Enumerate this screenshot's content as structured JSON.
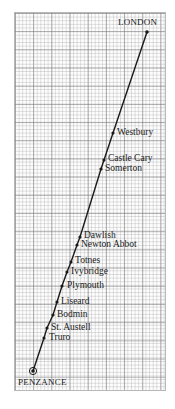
{
  "diagram": {
    "type": "line-route",
    "line_color": "#1a1a1a",
    "grid": {
      "left": 14,
      "top": 12,
      "width": 152,
      "height": 379,
      "minor_px": 3.64,
      "major_every": 5
    },
    "stations": [
      {
        "name": "LONDON",
        "x": 147,
        "y": 32,
        "label_x": 118,
        "label_y": 18,
        "terminal": true,
        "caps": true
      },
      {
        "name": "Westbury",
        "x": 113,
        "y": 133,
        "label_x": 117,
        "label_y": 128,
        "terminal": false
      },
      {
        "name": "Castle Cary",
        "x": 104,
        "y": 160,
        "label_x": 108,
        "label_y": 154,
        "terminal": false
      },
      {
        "name": "Somerton",
        "x": 101,
        "y": 169,
        "label_x": 105,
        "label_y": 164,
        "terminal": false
      },
      {
        "name": "Dawlish",
        "x": 80,
        "y": 237,
        "label_x": 84,
        "label_y": 231,
        "terminal": false
      },
      {
        "name": "Newton Abbot",
        "x": 77,
        "y": 245,
        "label_x": 81,
        "label_y": 240,
        "terminal": false
      },
      {
        "name": "Totnes",
        "x": 71,
        "y": 262,
        "label_x": 75,
        "label_y": 256,
        "terminal": false
      },
      {
        "name": "Ivybridge",
        "x": 67,
        "y": 272,
        "label_x": 71,
        "label_y": 267,
        "terminal": false
      },
      {
        "name": "Plymouth",
        "x": 62,
        "y": 286,
        "label_x": 67,
        "label_y": 281,
        "terminal": false
      },
      {
        "name": "Liseard",
        "x": 57,
        "y": 302,
        "label_x": 61,
        "label_y": 297,
        "terminal": false
      },
      {
        "name": "Bodmin",
        "x": 53,
        "y": 315,
        "label_x": 57,
        "label_y": 310,
        "terminal": false
      },
      {
        "name": "St. Austell",
        "x": 47,
        "y": 328,
        "label_x": 51,
        "label_y": 323,
        "terminal": false
      },
      {
        "name": "Truro",
        "x": 44,
        "y": 338,
        "label_x": 49,
        "label_y": 333,
        "terminal": false
      },
      {
        "name": "PENZANCE",
        "x": 33,
        "y": 371,
        "label_x": 18,
        "label_y": 378,
        "terminal": true,
        "caps": true
      }
    ]
  }
}
